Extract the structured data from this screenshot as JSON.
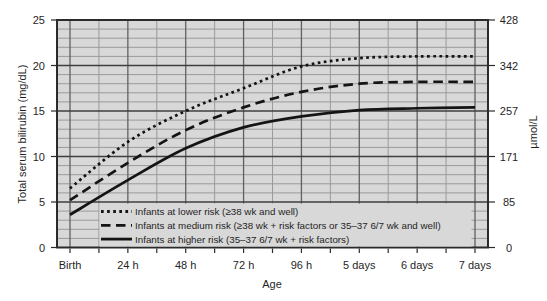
{
  "figure": {
    "left_axis_title": "Total serum bilirubin (mg/dL)",
    "right_axis_title": "µmol/L",
    "x_axis_title": "Age"
  },
  "chart_data": {
    "type": "line",
    "title": "",
    "xlabel": "Age",
    "ylabel_left": "Total serum bilirubin (mg/dL)",
    "ylabel_right": "µmol/L",
    "categories": [
      "Birth",
      "24 h",
      "48 h",
      "72 h",
      "96 h",
      "5 days",
      "6 days",
      "7 days"
    ],
    "ylim": [
      0,
      25
    ],
    "yticks_left": [
      0,
      5,
      10,
      15,
      20,
      25
    ],
    "yticks_right": [
      0,
      85,
      171,
      257,
      342,
      428
    ],
    "grid": "on",
    "grid_minor_step_y": 1,
    "grid_minor_step_x": 0.5,
    "legend_position": "inside-bottom-left",
    "series": [
      {
        "name": "Infants at lower risk (≥38 wk and well)",
        "style": "dotted",
        "values": [
          6.5,
          11.6,
          15.0,
          17.5,
          19.9,
          20.8,
          21.0,
          21.0
        ]
      },
      {
        "name": "Infants at medium risk (≥38 wk + risk factors or 35–37 6/7 wk and well)",
        "style": "dashed",
        "values": [
          5.2,
          9.3,
          12.9,
          15.4,
          17.1,
          18.0,
          18.2,
          18.2
        ]
      },
      {
        "name": "Infants at higher risk (35–37 6/7 wk + risk factors)",
        "style": "solid",
        "values": [
          3.6,
          7.4,
          10.9,
          13.2,
          14.4,
          15.1,
          15.3,
          15.4
        ]
      }
    ],
    "colors": {
      "page": "#ffffff",
      "plot_background": "#d8d8d8",
      "grid_minor": "#9a9a9a",
      "grid_major_h": "#3f3f3f",
      "grid_major_v": "#606060",
      "border": "#2b2b2b",
      "curve": "#141414",
      "text": "#1f1f1f"
    }
  }
}
